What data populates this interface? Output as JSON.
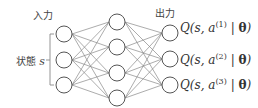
{
  "labels": {
    "input": "入力",
    "output": "出力",
    "state": "状態 ",
    "state_var": "s"
  },
  "network": {
    "layers": [
      3,
      4,
      3
    ]
  },
  "outputs": [
    {
      "q": "Q(s, a",
      "sup": "(1)",
      "tail": " | ",
      "theta": "θ",
      "close": ")"
    },
    {
      "q": "Q(s, a",
      "sup": "(2)",
      "tail": " | ",
      "theta": "θ",
      "close": ")"
    },
    {
      "q": "Q(s, a",
      "sup": "(3)",
      "tail": " | ",
      "theta": "θ",
      "close": ")"
    }
  ],
  "colors": {
    "line": "#888888",
    "node": "#555555"
  }
}
